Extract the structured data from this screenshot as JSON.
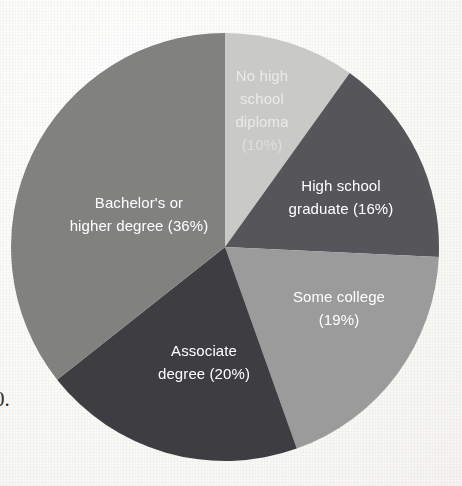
{
  "chart_data": {
    "type": "pie",
    "title": "",
    "subtitle": "",
    "xlabel": "",
    "ylabel": "",
    "legend_position": "none",
    "labels_inside_slices": true,
    "start_angle_deg": 0,
    "direction": "clockwise",
    "categories": [
      "No high school diploma",
      "High school graduate",
      "Some college",
      "Associate degree",
      "Bachelor's or higher degree"
    ],
    "values": [
      10,
      16,
      19,
      20,
      36
    ],
    "unit": "percent",
    "colors": [
      "#c9c9c7",
      "#56565a",
      "#9b9b9c",
      "#3e3e42",
      "#818180"
    ],
    "slices": [
      {
        "name": "No high school diploma",
        "value": 10,
        "color": "#c9c9c7",
        "label_lines": [
          "No high",
          "school",
          "diploma",
          "(10%)"
        ],
        "label_color": "#ffffff",
        "label_x": 262,
        "label_y": 112,
        "line_height": 23,
        "legibility": "faint"
      },
      {
        "name": "High school graduate",
        "value": 16,
        "color": "#56565a",
        "label_lines": [
          "High school",
          "graduate (16%)"
        ],
        "label_color": "#ffffff",
        "label_x": 341,
        "label_y": 199,
        "line_height": 23,
        "legibility": "clear"
      },
      {
        "name": "Some college",
        "value": 19,
        "color": "#9b9b9c",
        "label_lines": [
          "Some college",
          "(19%)"
        ],
        "label_color": "#ffffff",
        "label_x": 339,
        "label_y": 310,
        "line_height": 23,
        "legibility": "clear"
      },
      {
        "name": "Associate degree",
        "value": 20,
        "color": "#3e3e42",
        "label_lines": [
          "Associate",
          "degree (20%)"
        ],
        "label_color": "#ffffff",
        "label_x": 204,
        "label_y": 364,
        "line_height": 23,
        "legibility": "clear"
      },
      {
        "name": "Bachelor's or higher degree",
        "value": 36,
        "color": "#818180",
        "label_lines": [
          "Bachelor's or",
          "higher degree (36%)"
        ],
        "label_color": "#ffffff",
        "label_x": 139,
        "label_y": 216,
        "line_height": 23,
        "legibility": "clear"
      }
    ],
    "geometry": {
      "center_x": 225,
      "center_y": 247,
      "radius": 214
    }
  },
  "page": {
    "background_color": "#fbfbf8",
    "margin_glyph": "0."
  }
}
